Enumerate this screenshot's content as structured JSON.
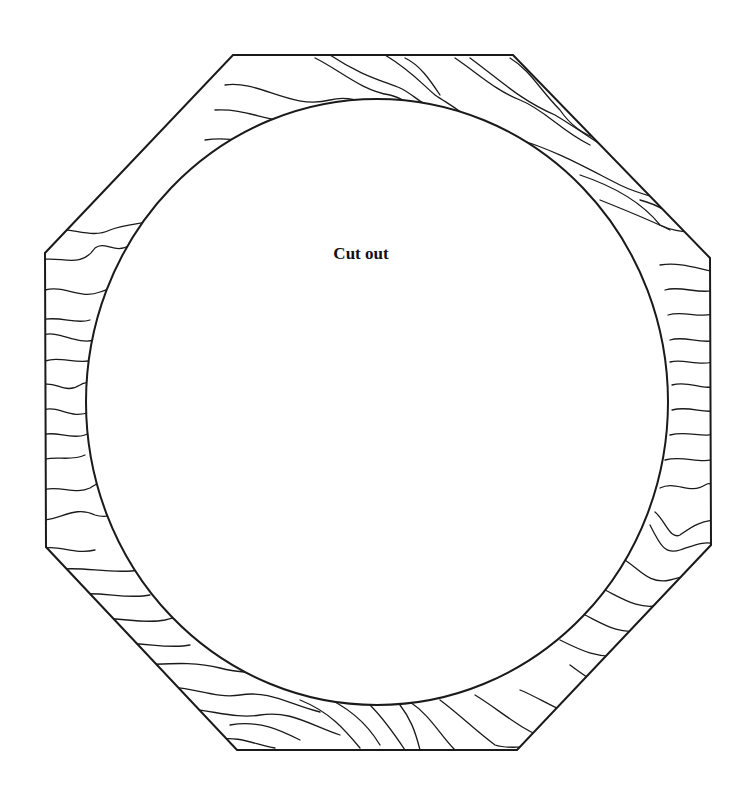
{
  "diagram": {
    "title": "",
    "center_label": "Cut out",
    "shapes": {
      "outer": {
        "type": "octagon",
        "points": [
          [
            233,
            55
          ],
          [
            513,
            55
          ],
          [
            710,
            258
          ],
          [
            711,
            545
          ],
          [
            517,
            750
          ],
          [
            237,
            750
          ],
          [
            46,
            547
          ],
          [
            45,
            253
          ]
        ],
        "fill": "wood-grain hatching",
        "stroke": "#1a1a1a"
      },
      "inner": {
        "type": "circle",
        "center": [
          377,
          402
        ],
        "rx": 291,
        "ry": 303,
        "fill": "#ffffff",
        "stroke": "#1a1a1a",
        "role": "cut-out region"
      }
    },
    "colors": {
      "background": "#ffffff",
      "line": "#1a1a1a"
    }
  }
}
